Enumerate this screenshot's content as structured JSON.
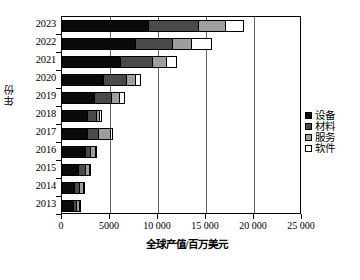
{
  "chart_data": {
    "type": "bar",
    "orientation": "horizontal",
    "stacked": true,
    "title": "",
    "xlabel": "全球产值/百万美元",
    "ylabel": "年份",
    "xlim": [
      0,
      25000
    ],
    "xticks": [
      0,
      5000,
      10000,
      15000,
      20000,
      25000
    ],
    "xtick_labels": [
      "0",
      "5000",
      "10 000",
      "15 000",
      "20 000",
      "25 000"
    ],
    "grid": true,
    "legend_position": "right",
    "categories": [
      "2023",
      "2022",
      "2021",
      "2020",
      "2019",
      "2018",
      "2017",
      "2016",
      "2015",
      "2014",
      "2013"
    ],
    "series": [
      {
        "name": "设备",
        "color": "#0a0a0a",
        "values": [
          9100,
          7700,
          6100,
          4350,
          3450,
          2700,
          2700,
          2450,
          1750,
          1400,
          1300
        ]
      },
      {
        "name": "材料",
        "color": "#4a4a4a",
        "values": [
          5300,
          4000,
          3450,
          2500,
          1900,
          1100,
          1250,
          700,
          850,
          550,
          350
        ]
      },
      {
        "name": "服务",
        "color": "#9e9e9e",
        "values": [
          2900,
          2100,
          1650,
          1050,
          850,
          350,
          1350,
          600,
          500,
          600,
          450
        ]
      },
      {
        "name": "软件",
        "color": "#ffffff",
        "values": [
          2000,
          2100,
          1100,
          600,
          700,
          300,
          300,
          250,
          200,
          150,
          100
        ]
      }
    ],
    "totals": [
      19300,
      15900,
      12300,
      8500,
      6900,
      4450,
      5600,
      4000,
      3300,
      2700,
      2200
    ]
  },
  "legend": {
    "items": [
      {
        "label": "设备",
        "color": "#0a0a0a"
      },
      {
        "label": "材料",
        "color": "#4a4a4a"
      },
      {
        "label": "服务",
        "color": "#9e9e9e"
      },
      {
        "label": "软件",
        "color": "#ffffff"
      }
    ]
  }
}
